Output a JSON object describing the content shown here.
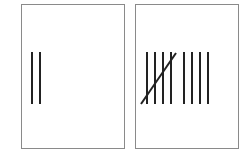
{
  "cards": [
    {
      "name": "tally-two",
      "count": 2,
      "strokes_x": [
        10,
        18
      ],
      "gate": false
    },
    {
      "name": "tally-nine",
      "count": 9,
      "strokes_x": [
        11,
        19,
        27,
        35,
        48,
        56,
        64,
        72
      ],
      "gate": true
    }
  ],
  "colors": {
    "stroke": "#222222",
    "border": "#8a8a8a"
  }
}
